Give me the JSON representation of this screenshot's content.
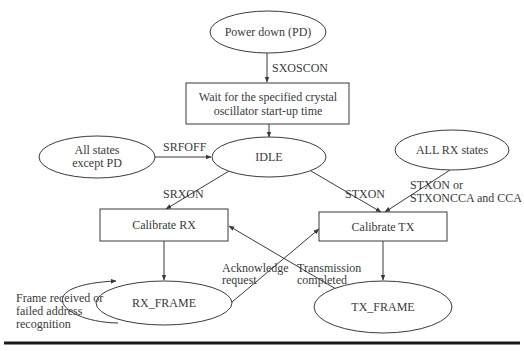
{
  "diagram": {
    "type": "state-transition",
    "nodes": {
      "power_down": {
        "label": "Power down (PD)",
        "shape": "ellipse"
      },
      "wait_osc": {
        "label_lines": [
          "Wait for the specified crystal",
          "oscillator start-up time"
        ],
        "shape": "rect"
      },
      "idle": {
        "label": "IDLE",
        "shape": "ellipse"
      },
      "all_except_pd": {
        "label_lines": [
          "All states",
          "except PD"
        ],
        "shape": "ellipse"
      },
      "all_rx": {
        "label": "ALL RX states",
        "shape": "ellipse"
      },
      "calibrate_rx": {
        "label": "Calibrate RX",
        "shape": "rect"
      },
      "calibrate_tx": {
        "label": "Calibrate TX",
        "shape": "rect"
      },
      "rx_frame": {
        "label": "RX_FRAME",
        "shape": "ellipse"
      },
      "tx_frame": {
        "label": "TX_FRAME",
        "shape": "ellipse"
      }
    },
    "edges": {
      "sxoscon": {
        "from": "power_down",
        "to": "wait_osc",
        "label": "SXOSCON"
      },
      "wait_to_idle": {
        "from": "wait_osc",
        "to": "idle",
        "label": ""
      },
      "srfoff": {
        "from": "all_except_pd",
        "to": "idle",
        "label": "SRFOFF"
      },
      "srxon": {
        "from": "idle",
        "to": "calibrate_rx",
        "label": "SRXON"
      },
      "stxon": {
        "from": "idle",
        "to": "calibrate_tx",
        "label": "STXON"
      },
      "stxon_cca": {
        "from": "all_rx",
        "to": "calibrate_tx",
        "label_lines": [
          "STXON or",
          "STXONCCA and CCA"
        ]
      },
      "rx_cal_done": {
        "from": "calibrate_rx",
        "to": "rx_frame",
        "label": ""
      },
      "tx_cal_done": {
        "from": "calibrate_tx",
        "to": "tx_frame",
        "label": ""
      },
      "ack_request": {
        "from": "rx_frame",
        "to": "calibrate_tx",
        "label_lines": [
          "Acknowledge",
          "request"
        ]
      },
      "tx_completed": {
        "from": "tx_frame",
        "to": "calibrate_rx",
        "label_lines": [
          "Transmission",
          "completed"
        ]
      },
      "rx_self_loop": {
        "from": "rx_frame",
        "to": "rx_frame",
        "label_lines": [
          "Frame received or",
          "failed address",
          "recognition"
        ]
      }
    }
  }
}
